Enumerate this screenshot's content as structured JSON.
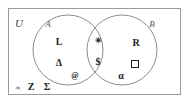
{
  "diagram": {
    "type": "venn",
    "universe_label": "U",
    "sets": [
      {
        "id": "A",
        "label": "A",
        "side": "left"
      },
      {
        "id": "B",
        "label": "B",
        "side": "right"
      }
    ],
    "regions": {
      "a_only": {
        "name": "A only",
        "elements": [
          {
            "symbol": "L",
            "kind": "letter"
          },
          {
            "symbol": "Δ",
            "kind": "greek"
          },
          {
            "symbol": "@",
            "kind": "symbol"
          }
        ]
      },
      "intersection": {
        "name": "A intersect B",
        "elements": [
          {
            "symbol": "✳",
            "kind": "symbol"
          },
          {
            "symbol": "$",
            "kind": "symbol"
          }
        ]
      },
      "b_only": {
        "name": "B only",
        "elements": [
          {
            "symbol": "R",
            "kind": "letter"
          },
          {
            "symbol": "□",
            "kind": "shape"
          },
          {
            "symbol": "α",
            "kind": "greek"
          }
        ]
      },
      "outside": {
        "name": "Outside A and B",
        "elements": [
          {
            "symbol": "∞",
            "kind": "symbol"
          },
          {
            "symbol": "Z",
            "kind": "letter"
          },
          {
            "symbol": "Σ",
            "kind": "greek"
          }
        ]
      }
    },
    "colors": {
      "stroke": "#8d8d8d",
      "border": "#9a9a9a",
      "text": "#222222",
      "label": "#555555",
      "background": "#ffffff"
    }
  }
}
